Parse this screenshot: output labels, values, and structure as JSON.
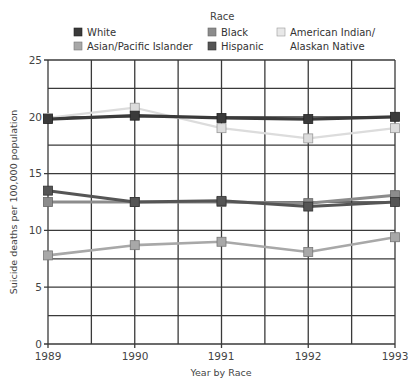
{
  "chart_data": {
    "type": "line",
    "title": "",
    "legend_title": "Race",
    "xlabel": "Year by Race",
    "ylabel": "Suicide deaths per 100,000 population",
    "x": [
      "1989",
      "1990",
      "1991",
      "1992",
      "1993"
    ],
    "ylim": [
      0,
      25
    ],
    "yticks": [
      0,
      5,
      10,
      15,
      20,
      25
    ],
    "grid": true,
    "legend_position": "top",
    "series": [
      {
        "name": "White",
        "color": "#3a3a3a",
        "values": [
          19.8,
          20.1,
          19.9,
          19.8,
          20.0
        ]
      },
      {
        "name": "Black",
        "color": "#8c8c8c",
        "values": [
          12.5,
          12.5,
          12.5,
          12.4,
          13.1
        ]
      },
      {
        "name": "American Indian/ Alaskan Native",
        "color": "#dcdcdc",
        "values": [
          19.9,
          20.8,
          19.0,
          18.1,
          19.0
        ]
      },
      {
        "name": "Asian/Pacific Islander",
        "color": "#a8a8a8",
        "values": [
          7.8,
          8.7,
          9.0,
          8.1,
          9.4
        ]
      },
      {
        "name": "Hispanic",
        "color": "#555555",
        "values": [
          13.5,
          12.5,
          12.6,
          12.1,
          12.5
        ]
      }
    ]
  },
  "legend": {
    "title": "Race",
    "items": [
      {
        "label": "White",
        "color": "#3a3a3a"
      },
      {
        "label": "Asian/Pacific Islander",
        "color": "#a8a8a8"
      },
      {
        "label": "Black",
        "color": "#8c8c8c"
      },
      {
        "label": "Hispanic",
        "color": "#555555"
      },
      {
        "label_line1": "American Indian/",
        "label_line2": "Alaskan Native",
        "color": "#dcdcdc"
      }
    ]
  },
  "axes": {
    "x_label": "Year by Race",
    "y_label": "Suicide deaths per 100,000 population",
    "x_ticks": [
      "1989",
      "1990",
      "1991",
      "1992",
      "1993"
    ],
    "y_ticks": [
      "0",
      "5",
      "10",
      "15",
      "20",
      "25"
    ]
  }
}
